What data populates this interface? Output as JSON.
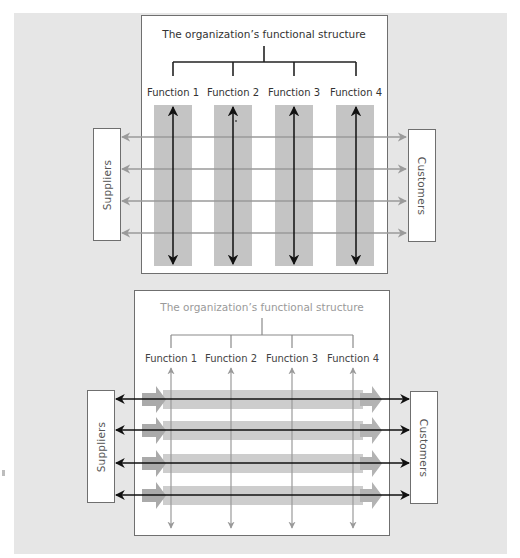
{
  "colors": {
    "background_panel": "#e6e6e6",
    "box_fill": "#ffffff",
    "box_border": "#6f6f6f",
    "stripe_fill": "#c4c4c4",
    "flow_bar_fill": "#cdcdcd",
    "flow_arrow_dark": "#aaaaaa",
    "black_arrow": "#111111",
    "gray_arrow": "#9a9a9a"
  },
  "top_diagram": {
    "title": "The organization’s functional structure",
    "functions": [
      "Function 1",
      "Function 2",
      "Function 3",
      "Function 4"
    ],
    "left_entity": "Suppliers",
    "right_entity": "Customers",
    "description": "Vertical functional silos (black double arrows) dominate; horizontal supplier-to-customer flows are thin gray arrows"
  },
  "bottom_diagram": {
    "title": "The organization’s functional structure",
    "functions": [
      "Function 1",
      "Function 2",
      "Function 3",
      "Function 4"
    ],
    "left_entity": "Suppliers",
    "right_entity": "Customers",
    "description": "Horizontal process flows (thick gray arrows with black double arrows) dominate; vertical functions are thin gray double arrows"
  }
}
